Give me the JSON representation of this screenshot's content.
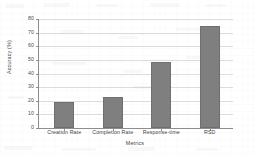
{
  "chart_data": {
    "type": "bar",
    "title": "",
    "xlabel": "Metrics",
    "ylabel": "Accuracy (%)",
    "categories": [
      "Creation Rate",
      "Completion Rate",
      "Response-time",
      "RSD"
    ],
    "values": [
      19,
      23,
      48.5,
      75
    ],
    "ylim": [
      0,
      80
    ],
    "yticks": [
      0,
      10,
      20,
      30,
      40,
      50,
      60,
      70,
      80
    ],
    "ytick_labels": [
      "0",
      "10",
      "20",
      "30",
      "40",
      "50",
      "60",
      "70",
      "80"
    ],
    "grid": true,
    "grid_axis": "y",
    "legend": false,
    "legend_position": "none",
    "bar_color": "#7f7f7f",
    "bar_edge_color": "#6f6f6f",
    "grid_color": "#dcdcdc",
    "axis_color": "#8d8d8d",
    "background_color": "#ffffff"
  }
}
